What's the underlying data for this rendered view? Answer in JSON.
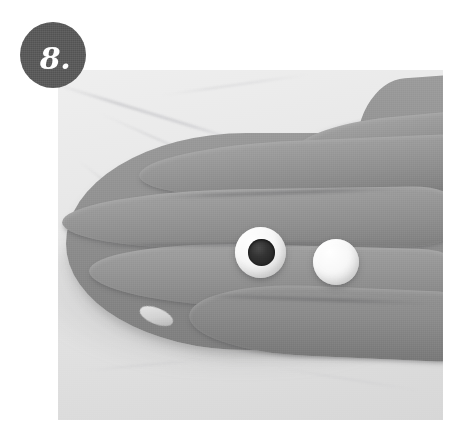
{
  "page": {
    "type": "instructional-step-photo",
    "background_color": "#ffffff",
    "width": 463,
    "height": 439
  },
  "badge": {
    "name": "step-number-badge",
    "number": "8.",
    "shape": "circle",
    "background_color": "#595959",
    "text_color": "#ffffff",
    "diameter_px": 66,
    "position": {
      "left": 20,
      "top": 22
    }
  },
  "photo": {
    "name": "craft-step-photograph",
    "alt": "A palm-up hand holding two small white polymer clay balls, one rolled into an eye with a dark pupil",
    "frame": {
      "left": 58,
      "top": 70,
      "width": 385,
      "height": 350
    },
    "style": "black-and-white photograph",
    "background": {
      "label": "marble countertop",
      "color": "#e4e4e4",
      "vein_color": "#bcbcbe"
    },
    "subject": {
      "label": "hand",
      "orientation": "palm up, fingers pointing left, entering from right edge",
      "skin_tone_color": "#909090",
      "visible_fingers": 4,
      "fingernail_visible": true
    },
    "objects": [
      {
        "name": "clay-eye-ball",
        "label": "white clay ball with dark pupil",
        "color": "#f7f7f7",
        "pupil_color": "#262626",
        "has_pupil": true,
        "position_pct": {
          "left": 46.0,
          "top": 44.9
        },
        "size_pct": {
          "width": 13.3,
          "height": 14.6
        }
      },
      {
        "name": "clay-plain-ball",
        "label": "plain white clay ball",
        "color": "#f8f8f8",
        "has_pupil": false,
        "position_pct": {
          "left": 66.2,
          "top": 48.3
        },
        "size_pct": {
          "width": 12.0,
          "height": 13.2
        }
      }
    ]
  }
}
